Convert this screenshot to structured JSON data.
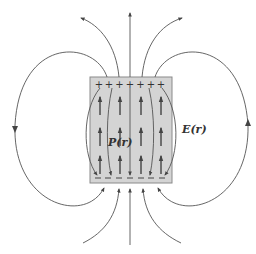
{
  "figure": {
    "labels": {
      "polarization": "P(r)",
      "field": "E(r)"
    },
    "surface_charges": {
      "top": "+ + + + + + +",
      "bottom": "− − − − − − −",
      "top_sign": "+",
      "bottom_sign": "−"
    },
    "colors": {
      "slab_fill": "#d4d4d4",
      "slab_stroke": "#8a8a8a",
      "line": "#555555",
      "background": "#ffffff"
    }
  }
}
